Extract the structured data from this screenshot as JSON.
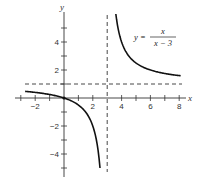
{
  "chart_data": {
    "type": "line",
    "title": "",
    "function": "y = x / (x - 3)",
    "annotation": {
      "lhs": "y =",
      "numerator": "x",
      "denominator": "x − 3"
    },
    "xlabel": "x",
    "ylabel": "y",
    "xlim": [
      -3.4,
      8.5
    ],
    "ylim": [
      -5.6,
      6.0
    ],
    "x_ticks": [
      -3,
      -2,
      -1,
      1,
      2,
      4,
      5,
      6,
      7,
      8
    ],
    "x_tick_labels": [
      {
        "value": -2,
        "label": "−2"
      },
      {
        "value": 2,
        "label": "2"
      },
      {
        "value": 4,
        "label": "4"
      },
      {
        "value": 6,
        "label": "6"
      },
      {
        "value": 8,
        "label": "8"
      }
    ],
    "y_ticks": [
      -5,
      -4,
      -3,
      -2,
      -1,
      1,
      2,
      3,
      4,
      5
    ],
    "y_tick_labels": [
      {
        "value": 4,
        "label": "4"
      },
      {
        "value": 2,
        "label": "2"
      },
      {
        "value": -2,
        "label": "−2"
      },
      {
        "value": -4,
        "label": "−4"
      }
    ],
    "asymptotes": {
      "vertical": 3,
      "horizontal": 1
    },
    "series": [
      {
        "name": "left branch",
        "domain": [
          -2.7,
          2.5
        ],
        "points": [
          [
            -2.7,
            0.47
          ],
          [
            -2,
            0.4
          ],
          [
            -1,
            0.25
          ],
          [
            0,
            0
          ],
          [
            1,
            -0.5
          ],
          [
            2,
            -2
          ],
          [
            2.5,
            -5
          ]
        ]
      },
      {
        "name": "right branch",
        "domain": [
          3.6,
          8.1
        ],
        "points": [
          [
            3.6,
            6
          ],
          [
            4,
            4
          ],
          [
            5,
            2.5
          ],
          [
            6,
            2
          ],
          [
            7,
            1.75
          ],
          [
            8,
            1.6
          ]
        ]
      }
    ],
    "grid": false,
    "legend": "none"
  }
}
